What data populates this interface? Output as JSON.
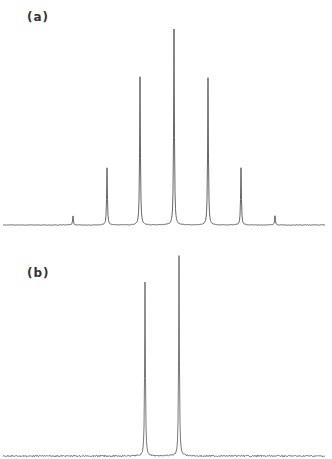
{
  "figure": {
    "panels": [
      {
        "id": "a",
        "label": "(a)"
      },
      {
        "id": "b",
        "label": "(b)"
      }
    ],
    "line_color": "#555555"
  },
  "chart_data": [
    {
      "type": "line",
      "title": "(a)",
      "description": "Spectrum with seven equally spaced sharp peaks, symmetric intensity pattern (approx. binomial 1:6:15:20:15:6:1)",
      "xlabel": "",
      "ylabel": "",
      "grid": false,
      "axes_visible": false,
      "peaks": [
        {
          "position": 1,
          "relative_height": 0.05
        },
        {
          "position": 2,
          "relative_height": 0.29
        },
        {
          "position": 3,
          "relative_height": 0.75
        },
        {
          "position": 4,
          "relative_height": 1.0
        },
        {
          "position": 5,
          "relative_height": 0.75
        },
        {
          "position": 6,
          "relative_height": 0.29
        },
        {
          "position": 7,
          "relative_height": 0.05
        }
      ]
    },
    {
      "type": "line",
      "title": "(b)",
      "description": "Spectrum with two sharp peaks on a noisy baseline",
      "xlabel": "",
      "ylabel": "",
      "grid": false,
      "axes_visible": false,
      "peaks": [
        {
          "position": 3.1,
          "relative_height": 0.87
        },
        {
          "position": 4.1,
          "relative_height": 1.0
        }
      ]
    }
  ],
  "render": {
    "a": {
      "baseline_y": 225,
      "x_start": 3,
      "x_end": 325,
      "peaks_px": [
        {
          "x": 73,
          "h": 9
        },
        {
          "x": 107,
          "h": 57
        },
        {
          "x": 140,
          "h": 148
        },
        {
          "x": 174,
          "h": 196
        },
        {
          "x": 208,
          "h": 147
        },
        {
          "x": 241,
          "h": 57
        },
        {
          "x": 275,
          "h": 9
        }
      ]
    },
    "b": {
      "baseline_y": 456,
      "x_start": 3,
      "x_end": 325,
      "peaks_px": [
        {
          "x": 145,
          "h": 174
        },
        {
          "x": 179,
          "h": 200
        }
      ]
    }
  }
}
